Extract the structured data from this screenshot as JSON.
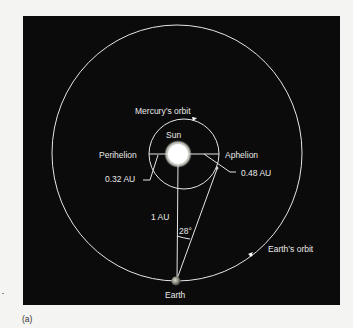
{
  "figure": {
    "panel_label": "(a)",
    "background": "#0b0b0b",
    "line_color": "#e6e6e6",
    "sun_color": "#ffffff"
  },
  "labels": {
    "mercury_orbit": "Mercury’s orbit",
    "sun": "Sun",
    "perihelion": "Perihelion",
    "aphelion": "Aphelion",
    "perihelion_distance": "0.32 AU",
    "aphelion_distance": "0.48 AU",
    "earth_sun_distance": "1 AU",
    "angle": "28°",
    "earth_orbit": "Earth’s orbit",
    "earth": "Earth"
  }
}
